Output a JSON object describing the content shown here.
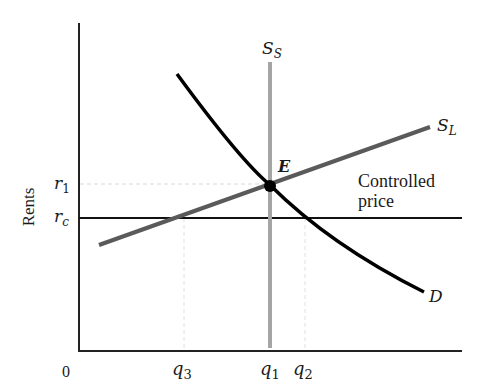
{
  "diagram": {
    "y_axis": {
      "label": "Rents",
      "ticks": [
        {
          "symbol": "r",
          "sub": "1"
        },
        {
          "symbol": "r",
          "sub": "c"
        }
      ]
    },
    "x_axis": {
      "origin": "0",
      "ticks": [
        {
          "symbol": "q",
          "sub": "3"
        },
        {
          "symbol": "q",
          "sub": "1"
        },
        {
          "symbol": "q",
          "sub": "2"
        }
      ]
    },
    "curves": {
      "short_run_supply": {
        "symbol": "S",
        "sub": "S",
        "color": "#a0a0a0"
      },
      "long_run_supply": {
        "symbol": "S",
        "sub": "L",
        "color": "#5a5a5a"
      },
      "demand": {
        "symbol": "D",
        "color": "#000000"
      }
    },
    "equilibrium": {
      "label": "E"
    },
    "controlled_price": {
      "line1": "Controlled",
      "line2": "price",
      "color": "#000000"
    }
  }
}
